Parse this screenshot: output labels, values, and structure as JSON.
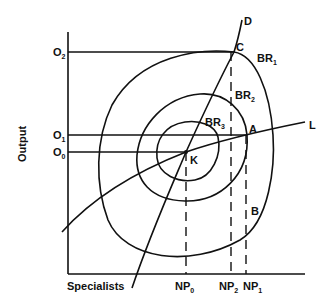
{
  "diagram": {
    "axes": {
      "x_label": "Specialists",
      "y_label": "Output"
    },
    "y_ticks": [
      {
        "id": "O2",
        "base": "O",
        "sub": "2"
      },
      {
        "id": "O1",
        "base": "O",
        "sub": "1"
      },
      {
        "id": "O0",
        "base": "O",
        "sub": "0"
      }
    ],
    "x_ticks": [
      {
        "id": "NP0",
        "base": "NP",
        "sub": "0"
      },
      {
        "id": "NP2",
        "base": "NP",
        "sub": "2"
      },
      {
        "id": "NP1",
        "base": "NP",
        "sub": "1"
      }
    ],
    "curves": [
      {
        "id": "BR1",
        "base": "BR",
        "sub": "1"
      },
      {
        "id": "BR2",
        "base": "BR",
        "sub": "2"
      },
      {
        "id": "BR3",
        "base": "BR",
        "sub": "3"
      }
    ],
    "lines": {
      "D": "D",
      "L": "L"
    },
    "points": {
      "C": "C",
      "A": "A",
      "K": "K",
      "B": "B"
    },
    "color": "#111111"
  }
}
